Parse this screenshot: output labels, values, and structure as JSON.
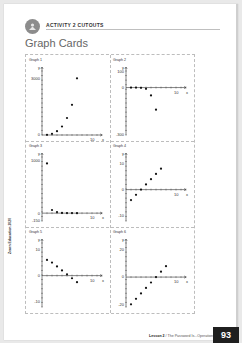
{
  "header": {
    "badge_icon": "activity-badge-icon",
    "activity_label": "ACTIVITY 2 CUTOUTS",
    "title": "Graph Cards"
  },
  "side_text": "Zearn Education 2020",
  "footer": {
    "lesson": "Lesson 2",
    "separator": " / ",
    "topic": "The Password Is...Operations!",
    "page_number": "93"
  },
  "chart_data": [
    {
      "type": "scatter",
      "title": "Graph 1",
      "xlabel": "x",
      "ylabel": "y",
      "x_tick_label": "10",
      "y_tick_labels": [
        "3000",
        "0"
      ],
      "xlim": [
        0,
        12
      ],
      "ylim": [
        0,
        3600
      ],
      "x": [
        1,
        2,
        3,
        4,
        5,
        6,
        7
      ],
      "y": [
        10,
        60,
        200,
        450,
        900,
        1600,
        3000
      ]
    },
    {
      "type": "scatter",
      "title": "Graph 2",
      "xlabel": "x",
      "ylabel": "y",
      "x_tick_label": "10",
      "y_tick_labels": [
        "100",
        "0",
        "-300"
      ],
      "xlim": [
        0,
        12
      ],
      "ylim": [
        -300,
        130
      ],
      "x": [
        1,
        2,
        3,
        4,
        5,
        6
      ],
      "y": [
        0,
        0,
        -2,
        -8,
        -50,
        -140
      ]
    },
    {
      "type": "scatter",
      "title": "Graph 3",
      "xlabel": "x",
      "ylabel": "y",
      "x_tick_label": "10",
      "y_tick_labels": [
        "1000",
        "0",
        "-150"
      ],
      "xlim": [
        0,
        12
      ],
      "ylim": [
        -150,
        1150
      ],
      "x": [
        1,
        2,
        3,
        4,
        5,
        6,
        7
      ],
      "y": [
        950,
        60,
        20,
        5,
        2,
        1,
        0
      ]
    },
    {
      "type": "scatter",
      "title": "Graph 4",
      "xlabel": "x",
      "ylabel": "y",
      "x_tick_label": "10",
      "y_tick_labels": [
        "10",
        "0",
        "-10"
      ],
      "xlim": [
        0,
        12
      ],
      "ylim": [
        -12,
        14
      ],
      "x": [
        1,
        2,
        3,
        4,
        5,
        6,
        7
      ],
      "y": [
        -4,
        -2,
        0,
        2,
        4,
        6,
        8
      ]
    },
    {
      "type": "scatter",
      "title": "Graph 5",
      "xlabel": "x",
      "ylabel": "y",
      "x_tick_label": "10",
      "y_tick_labels": [
        "10",
        "0",
        "-10"
      ],
      "xlim": [
        0,
        12
      ],
      "ylim": [
        -12,
        14
      ],
      "x": [
        1,
        2,
        3,
        4,
        5,
        6,
        7
      ],
      "y": [
        6,
        5,
        3.5,
        2,
        0.5,
        -1,
        -2.5
      ]
    },
    {
      "type": "scatter",
      "title": "Graph 6",
      "xlabel": "x",
      "ylabel": "y",
      "x_tick_label": "10",
      "y_tick_labels": [
        "20",
        "0",
        "-20"
      ],
      "xlim": [
        0,
        12
      ],
      "ylim": [
        -22,
        28
      ],
      "x": [
        1,
        2,
        3,
        4,
        5,
        6,
        7,
        8
      ],
      "y": [
        -20,
        -16,
        -12,
        -8,
        -4,
        0,
        4,
        8
      ]
    }
  ]
}
